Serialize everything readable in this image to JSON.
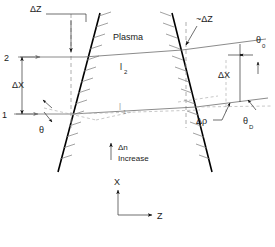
{
  "figure": {
    "title_visible": false,
    "region_label": "Plasma",
    "gradient_note": {
      "symbol": "Δn",
      "word": "Increase"
    },
    "axes": {
      "vertical": "X",
      "horizontal": "Z"
    },
    "rays": [
      {
        "id": "2",
        "path_label": "l",
        "path_sub": "2"
      },
      {
        "id": "1",
        "path_label": "l",
        "path_sub": "1"
      }
    ],
    "labels": {
      "delta_z_left": "ΔZ",
      "delta_z_right": "~ΔZ",
      "delta_x_left": "ΔX",
      "delta_x_right": "ΔX",
      "theta_in": "θ",
      "theta_0_base": "θ",
      "theta_0_sub": "0",
      "theta_D_base": "θ",
      "theta_D_sub": "D",
      "delta_rho": "Δρ"
    },
    "colors": {
      "boundary": "#000000",
      "ray": "#6d6d6d",
      "dashed": "#9a9a9a",
      "hatch": "#7a7a7a",
      "text": "#1a1a1a",
      "background": "#ffffff"
    }
  }
}
